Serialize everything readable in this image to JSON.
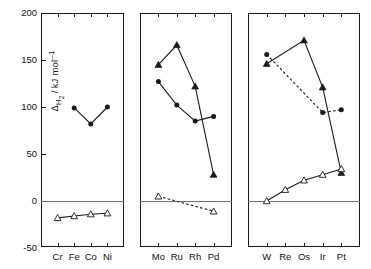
{
  "chart_data": {
    "type": "line",
    "title": "",
    "xlabel": "",
    "ylabel": "ΔH₂ / kJ mol⁻¹",
    "ylim": [
      -50,
      200
    ],
    "yticks": [
      -50,
      0,
      50,
      100,
      150,
      200
    ],
    "ytick_labels": [
      "-50",
      "0",
      "50",
      "100",
      "150",
      "200"
    ],
    "grid": false,
    "legend": "none",
    "zero_line": true,
    "panels": [
      {
        "id": "panel-3d",
        "categories": [
          "Cr",
          "Fe",
          "Co",
          "Ni"
        ],
        "series": [
          {
            "name": "filled-circle-series",
            "marker": "filled-circle",
            "line": "solid",
            "x": [
              "Fe",
              "Co",
              "Ni"
            ],
            "values": [
              99,
              82,
              100
            ]
          },
          {
            "name": "open-triangle-series",
            "marker": "open-triangle",
            "line": "solid",
            "x": [
              "Cr",
              "Fe",
              "Co",
              "Ni"
            ],
            "values": [
              -18,
              -16,
              -14,
              -13
            ]
          }
        ]
      },
      {
        "id": "panel-4d",
        "categories": [
          "Mo",
          "Ru",
          "Rh",
          "Pd"
        ],
        "series": [
          {
            "name": "filled-triangle-series",
            "marker": "filled-triangle",
            "line": "solid",
            "x": [
              "Mo",
              "Ru",
              "Rh",
              "Pd"
            ],
            "values": [
              145,
              166,
              122,
              28
            ]
          },
          {
            "name": "filled-circle-series",
            "marker": "filled-circle",
            "line": "solid",
            "x": [
              "Mo",
              "Ru",
              "Rh",
              "Pd"
            ],
            "values": [
              127,
              102,
              85,
              90
            ]
          },
          {
            "name": "open-triangle-series",
            "marker": "open-triangle",
            "line": "dashed",
            "x": [
              "Mo",
              "Pd"
            ],
            "values": [
              5,
              -11
            ]
          }
        ]
      },
      {
        "id": "panel-5d",
        "categories": [
          "W",
          "Re",
          "Os",
          "Ir",
          "Pt"
        ],
        "series": [
          {
            "name": "filled-triangle-series",
            "marker": "filled-triangle",
            "line": "solid",
            "x": [
              "W",
              "Os",
              "Ir",
              "Pt"
            ],
            "values": [
              146,
              171,
              121,
              30
            ]
          },
          {
            "name": "filled-circle-series",
            "marker": "filled-circle",
            "line": "dashed",
            "x": [
              "W",
              "Ir",
              "Pt"
            ],
            "values": [
              156,
              94,
              97
            ]
          },
          {
            "name": "open-triangle-series",
            "marker": "open-triangle",
            "line": "solid",
            "x": [
              "W",
              "Re",
              "Os",
              "Ir",
              "Pt"
            ],
            "values": [
              0,
              12,
              22,
              28,
              34
            ]
          }
        ]
      }
    ],
    "colors": {
      "ink": "#1a1a1a",
      "zero_line": "#6e6e6e",
      "background": "#ffffff"
    }
  }
}
